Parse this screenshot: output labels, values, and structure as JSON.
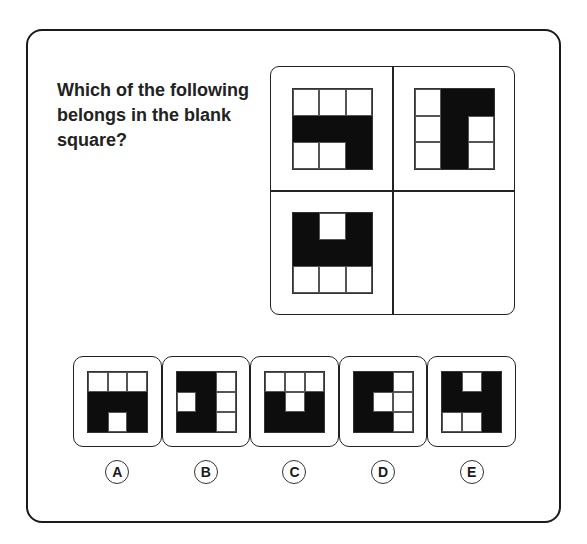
{
  "question": {
    "text": "Which of the following belongs in the blank square?"
  },
  "puzzle": {
    "cells": [
      {
        "position": "top-left",
        "pattern": [
          [
            0,
            0,
            0
          ],
          [
            1,
            1,
            1
          ],
          [
            0,
            0,
            1
          ]
        ]
      },
      {
        "position": "top-right",
        "pattern": [
          [
            0,
            1,
            1
          ],
          [
            0,
            1,
            0
          ],
          [
            0,
            1,
            0
          ]
        ]
      },
      {
        "position": "bottom-left",
        "pattern": [
          [
            1,
            0,
            1
          ],
          [
            1,
            1,
            1
          ],
          [
            0,
            0,
            0
          ]
        ]
      },
      {
        "position": "bottom-right",
        "pattern": null
      }
    ]
  },
  "options": [
    {
      "letter": "A",
      "pattern": [
        [
          0,
          0,
          0
        ],
        [
          1,
          1,
          1
        ],
        [
          1,
          0,
          1
        ]
      ]
    },
    {
      "letter": "B",
      "pattern": [
        [
          1,
          1,
          0
        ],
        [
          0,
          1,
          0
        ],
        [
          1,
          1,
          0
        ]
      ]
    },
    {
      "letter": "C",
      "pattern": [
        [
          0,
          0,
          0
        ],
        [
          1,
          0,
          1
        ],
        [
          1,
          1,
          1
        ]
      ]
    },
    {
      "letter": "D",
      "pattern": [
        [
          1,
          1,
          0
        ],
        [
          1,
          0,
          0
        ],
        [
          1,
          1,
          0
        ]
      ]
    },
    {
      "letter": "E",
      "pattern": [
        [
          1,
          0,
          1
        ],
        [
          1,
          1,
          1
        ],
        [
          0,
          0,
          1
        ]
      ]
    }
  ],
  "colors": {
    "filled": "#0d0d0d",
    "empty": "#ffffff",
    "border": "#222222"
  }
}
